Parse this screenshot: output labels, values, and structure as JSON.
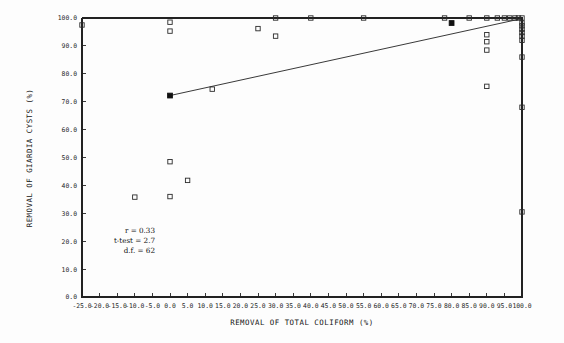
{
  "chart_data": {
    "type": "scatter",
    "title": "",
    "xlabel": "REMOVAL OF TOTAL COLIFORM (%)",
    "ylabel": "REMOVAL OF GIARDIA CYSTS (%)",
    "xlim": [
      -25.0,
      100.0
    ],
    "ylim": [
      0.0,
      100.0
    ],
    "grid": false,
    "legend": "none",
    "xticks": [
      "-25.0",
      "-20.0",
      "-15.0",
      "-10.0",
      "-5.0",
      "0.0",
      "5.0",
      "10.0",
      "15.0",
      "20.0",
      "25.0",
      "30.0",
      "35.0",
      "40.0",
      "45.0",
      "50.0",
      "55.0",
      "60.0",
      "65.0",
      "70.0",
      "75.0",
      "80.0",
      "85.0",
      "90.0",
      "95.0",
      "100.0"
    ],
    "xtick_values": [
      -25.0,
      -20.0,
      -15.0,
      -10.0,
      -5.0,
      0.0,
      5.0,
      10.0,
      15.0,
      20.0,
      25.0,
      30.0,
      35.0,
      40.0,
      45.0,
      50.0,
      55.0,
      60.0,
      65.0,
      70.0,
      75.0,
      80.0,
      85.0,
      90.0,
      95.0,
      100.0
    ],
    "yticks": [
      "0.0",
      "10.0",
      "20.0",
      "30.0",
      "40.0",
      "50.0",
      "60.0",
      "70.0",
      "80.0",
      "90.0",
      "100.0"
    ],
    "ytick_values": [
      0.0,
      10.0,
      20.0,
      30.0,
      40.0,
      50.0,
      60.0,
      70.0,
      80.0,
      90.0,
      100.0
    ],
    "series": [
      {
        "name": "observations",
        "marker": "open-square",
        "points": [
          [
            -25.0,
            97.5
          ],
          [
            0.0,
            98.5
          ],
          [
            0.0,
            95.3
          ],
          [
            0.0,
            48.5
          ],
          [
            0.0,
            36.0
          ],
          [
            -10.0,
            35.8
          ],
          [
            5.0,
            41.8
          ],
          [
            12.0,
            74.5
          ],
          [
            25.0,
            96.2
          ],
          [
            30.0,
            93.5
          ],
          [
            30.0,
            100.0
          ],
          [
            40.0,
            100.0
          ],
          [
            55.0,
            100.0
          ],
          [
            78.0,
            100.0
          ],
          [
            85.0,
            100.0
          ],
          [
            90.0,
            100.0
          ],
          [
            93.0,
            100.0
          ],
          [
            95.0,
            100.0
          ],
          [
            96.5,
            100.0
          ],
          [
            98.0,
            100.0
          ],
          [
            99.0,
            100.0
          ],
          [
            100.0,
            100.0
          ],
          [
            90.0,
            94.0
          ],
          [
            90.0,
            91.5
          ],
          [
            90.0,
            88.5
          ],
          [
            90.0,
            75.5
          ],
          [
            100.0,
            98.2
          ],
          [
            100.0,
            97.2
          ],
          [
            100.0,
            96.0
          ],
          [
            100.0,
            94.8
          ],
          [
            100.0,
            93.5
          ],
          [
            100.0,
            92.0
          ],
          [
            100.0,
            86.0
          ],
          [
            100.0,
            68.0
          ],
          [
            100.0,
            30.5
          ]
        ]
      },
      {
        "name": "regression-endpoints",
        "marker": "filled-square",
        "points": [
          [
            0.0,
            72.2
          ],
          [
            80.0,
            98.2
          ]
        ]
      }
    ],
    "fit_line": {
      "label": "least-squares fit",
      "x0": 0.0,
      "y0": 72.2,
      "x1": 100.0,
      "y1": 99.8
    },
    "annotations": {
      "r_label": "r  =  0.33",
      "ttest_label": "t-test  =  2.7",
      "df_label": "d.f.  =  62"
    }
  },
  "colors": {
    "axis": "#222222",
    "marker": "#2b2b2b",
    "text": "#151515",
    "background": "#fdfdfd"
  }
}
